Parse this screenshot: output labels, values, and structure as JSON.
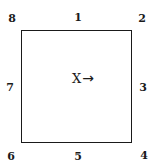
{
  "figure": {
    "center": {
      "symbol": "X",
      "direction_icon": "right-arrow-icon",
      "arrow_glyph": "→"
    },
    "positions": [
      {
        "id": "1",
        "location": "top-center",
        "label": "1"
      },
      {
        "id": "2",
        "location": "top-right",
        "label": "2"
      },
      {
        "id": "3",
        "location": "right-center",
        "label": "3"
      },
      {
        "id": "4",
        "location": "bottom-right",
        "label": "4"
      },
      {
        "id": "5",
        "location": "bottom-center",
        "label": "5"
      },
      {
        "id": "6",
        "location": "bottom-left",
        "label": "6"
      },
      {
        "id": "7",
        "location": "left-center",
        "label": "7"
      },
      {
        "id": "8",
        "location": "top-left",
        "label": "8"
      }
    ]
  }
}
